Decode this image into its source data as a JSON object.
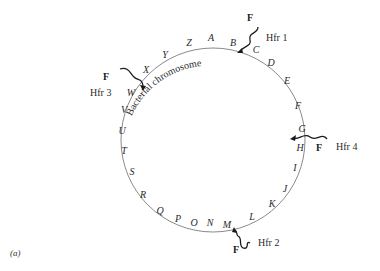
{
  "figure": {
    "panel_label": "(a)",
    "chromosome_label": "Bacterial chromosome",
    "genes": [
      "A",
      "B",
      "C",
      "D",
      "E",
      "F",
      "G",
      "H",
      "I",
      "J",
      "K",
      "L",
      "M",
      "N",
      "O",
      "P",
      "Q",
      "R",
      "S",
      "T",
      "U",
      "V",
      "W",
      "X",
      "Y",
      "Z"
    ],
    "hfr_strains": [
      {
        "name": "Hfr 1",
        "factor": "F",
        "insert_between": "B-C"
      },
      {
        "name": "Hfr 2",
        "factor": "F",
        "insert_between": "L-M"
      },
      {
        "name": "Hfr 3",
        "factor": "F",
        "insert_between": "W-X"
      },
      {
        "name": "Hfr 4",
        "factor": "F",
        "insert_between": "G-H"
      }
    ],
    "colors": {
      "circle": "#8a8a8a",
      "text": "#2a2a2a",
      "background": "#ffffff"
    }
  }
}
